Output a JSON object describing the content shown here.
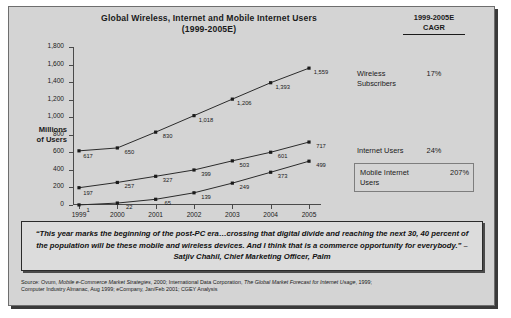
{
  "chart_data": {
    "type": "line",
    "title": "Global Wireless, Internet and Mobile Internet Users (1999-2005E)",
    "title_line1": "Global Wireless, Internet and Mobile Internet Users",
    "title_line2": "(1999-2005E)",
    "xlabel": "",
    "ylabel": "Millions of Users",
    "ylabel_line1": "Millions",
    "ylabel_line2": "of Users",
    "categories": [
      "1999",
      "2000",
      "2001",
      "2002",
      "2003",
      "2004",
      "2005"
    ],
    "ylim": [
      0,
      1800
    ],
    "yticks": [
      "0",
      "200",
      "400",
      "600",
      "800",
      "1,000",
      "1,200",
      "1,400",
      "1,600",
      "1,800"
    ],
    "grid": false,
    "legend_position": "right",
    "series": [
      {
        "name": "Wireless Subscribers",
        "values": [
          617,
          650,
          830,
          1018,
          1206,
          1393,
          1559
        ],
        "labels": [
          "617",
          "650",
          "830",
          "1,018",
          "1,206",
          "1,393",
          "1,559"
        ],
        "cagr": "17%"
      },
      {
        "name": "Internet Users",
        "values": [
          197,
          257,
          327,
          399,
          503,
          601,
          717
        ],
        "labels": [
          "197",
          "257",
          "327",
          "399",
          "503",
          "601",
          "717"
        ],
        "cagr": "24%"
      },
      {
        "name": "Mobile Internet Users",
        "values": [
          1,
          22,
          65,
          139,
          249,
          373,
          499
        ],
        "labels": [
          "1",
          "22",
          "65",
          "139",
          "249",
          "373",
          "499"
        ],
        "cagr": "207%"
      }
    ]
  },
  "cagr_header": {
    "period": "1999-2005E",
    "label": "CAGR"
  },
  "quote": {
    "text": "“This year marks the beginning of the post-PC era…crossing that digital divide and reaching the next 30, 40 percent of the population will be these mobile and wireless devices.  And I think that is a commerce opportunity for everybody.”  – Satjiv Chahil, Chief Marketing Officer, Palm"
  },
  "source": {
    "prefix": "Source:  Ovum, ",
    "italic1": "Mobile e-Commerce Market Strategies",
    "mid1": ", 2000; International Data Corporation, ",
    "italic2": "The Global Market Forecast for Internet Usage",
    "mid2": ", 1999;",
    "line2": "Computer Industry Almanac, Aug 1999; eCompany, Jan/Feb 2001; CGEY Analysis"
  }
}
